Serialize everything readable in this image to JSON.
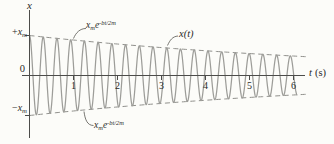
{
  "figure": {
    "y_axis_title": "x",
    "origin": "0",
    "y_plus": {
      "sign": "+",
      "base": "x",
      "sub": "m"
    },
    "y_minus": {
      "sign": "−",
      "base": "x",
      "sub": "m"
    },
    "x_axis_title_var": "t",
    "x_axis_title_unit": "(s)",
    "envelope_label": {
      "base": "x",
      "sub": "m",
      "factor": "e",
      "sup": "-bt/2m"
    },
    "curve_label": "x(t)"
  },
  "chart_data": {
    "type": "line",
    "xlabel": "t (s)",
    "ylabel": "x",
    "x_ticks": [
      1,
      2,
      3,
      4,
      5,
      6
    ],
    "x_range": [
      0,
      6.33
    ],
    "y_range_xm": [
      -1,
      1
    ],
    "grid": false,
    "legend": "none",
    "params": {
      "amplitude_xm": 1,
      "decay_b_over_2m_per_s": 0.12,
      "period_s": 0.312,
      "oscillation_frequency_hz": 3.2,
      "t_start": 0,
      "t_end": 6.09
    },
    "envelope_series": {
      "name": "x_m e^(-bt/2m)",
      "t": [
        0,
        1,
        2,
        3,
        4,
        5,
        6
      ],
      "amplitude_xm": [
        1.0,
        0.89,
        0.79,
        0.7,
        0.62,
        0.55,
        0.49
      ]
    },
    "colors": {
      "wave": "#9d9d99",
      "envelope": "#8f8f8b",
      "axis": "#4c4c4a",
      "text": "#2a2a28"
    }
  }
}
